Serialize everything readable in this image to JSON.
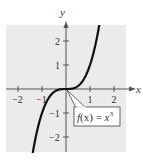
{
  "chart_data": {
    "type": "line",
    "title": "",
    "function_label": {
      "f": "f",
      "x": "(x)",
      "eq": " = ",
      "var": "x",
      "exp": "3"
    },
    "function_text": "f(x) = x^3",
    "xlabel": "x",
    "ylabel": "y",
    "xlim": [
      -2.5,
      2.5
    ],
    "ylim": [
      -2.6,
      2.6
    ],
    "x_ticks": [
      {
        "value": -2,
        "label": "−2"
      },
      {
        "value": -1,
        "label": "−1"
      },
      {
        "value": 1,
        "label": "1"
      },
      {
        "value": 2,
        "label": "2"
      }
    ],
    "y_ticks": [
      {
        "value": 2,
        "label": "2"
      },
      {
        "value": 1,
        "label": "1"
      },
      {
        "value": -1,
        "label": "−1"
      },
      {
        "value": -2,
        "label": "−2"
      }
    ],
    "series": [
      {
        "name": "f(x) = x^3",
        "x": [
          -1.37,
          -1.2,
          -1.0,
          -0.8,
          -0.6,
          -0.4,
          -0.2,
          0,
          0.2,
          0.4,
          0.6,
          0.8,
          1.0,
          1.2,
          1.37
        ],
        "y": [
          -2.57,
          -1.728,
          -1.0,
          -0.512,
          -0.216,
          -0.064,
          -0.008,
          0,
          0.008,
          0.064,
          0.216,
          0.512,
          1.0,
          1.728,
          2.57
        ]
      }
    ],
    "grid": false,
    "background": "#ebebeb",
    "curve_color": "#111111",
    "axis_color": "#555555"
  }
}
